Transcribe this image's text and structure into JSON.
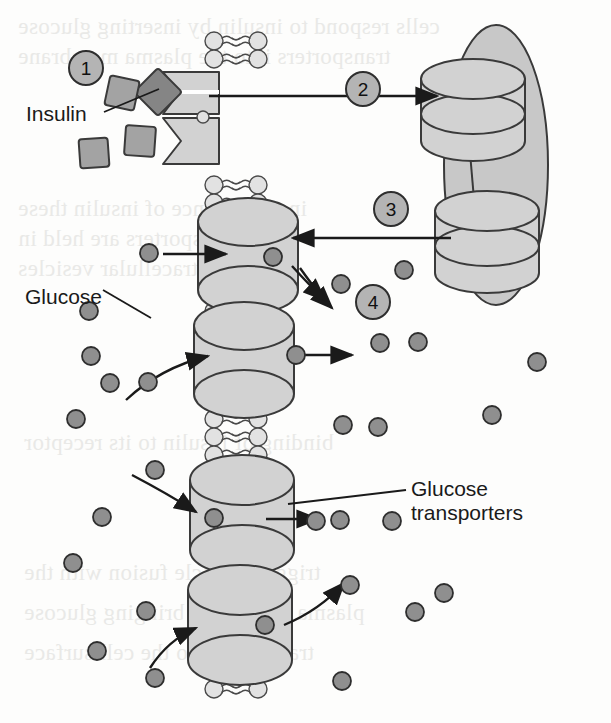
{
  "figure": {
    "background_color": "#fdfdfc"
  },
  "palette": {
    "protein_fill": "#c8c8c8",
    "protein_fill_light": "#d2d2d2",
    "protein_stroke": "#3a3a3a",
    "glucose_fill": "#8f8f8f",
    "glucose_stroke": "#2e2e2e",
    "insulin_fill": "#a3a3a3",
    "insulin_stroke": "#3a3a3a",
    "insulin_dark_fill": "#858585",
    "lipid_head_fill": "#e2e2e2",
    "lipid_stroke": "#4a4a4a",
    "step_circle_fill": "#b4b4b4",
    "step_circle_stroke": "#2e2e2e",
    "arrow_color": "#1a1a1a",
    "text_color": "#1a1a1a",
    "bleed_text_color": "#e9e9e7"
  },
  "labels": {
    "insulin": "Insulin",
    "glucose": "Glucose",
    "transporters_line1": "Glucose",
    "transporters_line2": "transporters"
  },
  "steps": [
    {
      "id": "step-1",
      "number": "1",
      "cx": 86,
      "cy": 68,
      "r": 17
    },
    {
      "id": "step-2",
      "number": "2",
      "cx": 363,
      "cy": 89,
      "r": 17
    },
    {
      "id": "step-3",
      "number": "3",
      "cx": 391,
      "cy": 209,
      "r": 17
    },
    {
      "id": "step-4",
      "number": "4",
      "cx": 373,
      "cy": 302,
      "r": 17
    }
  ],
  "membrane": {
    "left_heads_x": 214,
    "right_heads_x": 258,
    "top": 32,
    "bottom": 706,
    "head_radius": 9,
    "head_spacing": 18,
    "tail_length": 13
  },
  "insulin_receptor": {
    "upper": {
      "x": 163,
      "y": 72,
      "w": 56,
      "h": 42
    },
    "lower": {
      "x": 163,
      "y": 118,
      "w": 56,
      "h": 46
    }
  },
  "insulin_molecules": [
    {
      "id": "insulin-bound",
      "cx": 158,
      "cy": 92,
      "size": 34,
      "rotation": 45,
      "bound": true
    },
    {
      "id": "insulin-free-1",
      "cx": 122,
      "cy": 93,
      "size": 30,
      "rotation": 12,
      "bound": false
    },
    {
      "id": "insulin-free-2",
      "cx": 140,
      "cy": 141,
      "size": 30,
      "rotation": 4,
      "bound": false
    },
    {
      "id": "insulin-free-3",
      "cx": 94,
      "cy": 153,
      "size": 29,
      "rotation": -4,
      "bound": false
    }
  ],
  "vesicle": {
    "cx": 496,
    "cy": 165,
    "rx": 52,
    "ry": 140,
    "cylinders": [
      {
        "id": "vesicle-transporter-upper",
        "cx": 473,
        "cy": 110,
        "rx": 52,
        "ry": 20,
        "h": 62
      },
      {
        "id": "vesicle-transporter-lower",
        "cx": 487,
        "cy": 242,
        "rx": 52,
        "ry": 20,
        "h": 62
      }
    ]
  },
  "membrane_transporters": [
    {
      "id": "transporter-1",
      "cx": 248,
      "cy": 256,
      "rx": 50,
      "ry": 24,
      "gap": 20
    },
    {
      "id": "transporter-2",
      "cx": 244,
      "cy": 360,
      "rx": 50,
      "ry": 24,
      "gap": 20
    },
    {
      "id": "transporter-3",
      "cx": 242,
      "cy": 515,
      "rx": 52,
      "ry": 25,
      "gap": 20
    },
    {
      "id": "transporter-4",
      "cx": 240,
      "cy": 625,
      "rx": 52,
      "ry": 25,
      "gap": 20
    }
  ],
  "glucose_in_channel": [
    {
      "cx": 273,
      "cy": 257
    },
    {
      "cx": 296,
      "cy": 355
    },
    {
      "cx": 214,
      "cy": 518
    },
    {
      "cx": 265,
      "cy": 625
    }
  ],
  "glucose_left": [
    {
      "cx": 149,
      "cy": 253
    },
    {
      "cx": 89,
      "cy": 311
    },
    {
      "cx": 91,
      "cy": 356
    },
    {
      "cx": 110,
      "cy": 383
    },
    {
      "cx": 76,
      "cy": 419
    },
    {
      "cx": 148,
      "cy": 382
    },
    {
      "cx": 155,
      "cy": 470
    },
    {
      "cx": 102,
      "cy": 517
    },
    {
      "cx": 73,
      "cy": 563
    },
    {
      "cx": 146,
      "cy": 611
    },
    {
      "cx": 97,
      "cy": 651
    },
    {
      "cx": 155,
      "cy": 678
    }
  ],
  "glucose_right": [
    {
      "cx": 341,
      "cy": 284
    },
    {
      "cx": 404,
      "cy": 270
    },
    {
      "cx": 380,
      "cy": 343
    },
    {
      "cx": 418,
      "cy": 342
    },
    {
      "cx": 537,
      "cy": 362
    },
    {
      "cx": 343,
      "cy": 425
    },
    {
      "cx": 378,
      "cy": 427
    },
    {
      "cx": 492,
      "cy": 415
    },
    {
      "cx": 316,
      "cy": 521
    },
    {
      "cx": 392,
      "cy": 521
    },
    {
      "cx": 340,
      "cy": 520
    },
    {
      "cx": 350,
      "cy": 585
    },
    {
      "cx": 415,
      "cy": 612
    },
    {
      "cx": 342,
      "cy": 681
    },
    {
      "cx": 444,
      "cy": 593
    }
  ],
  "glucose_radius": 9,
  "arrows": {
    "step2": {
      "x1": 209,
      "y1": 96,
      "x2": 437,
      "y2": 96
    },
    "step3": {
      "x1": 451,
      "y1": 238,
      "x2": 293,
      "y2": 238
    },
    "step4_curve": "M 300 268 Q 320 296 332 308",
    "into_t1": {
      "x1": 163,
      "y1": 254,
      "x2": 226,
      "y2": 254
    },
    "out_t1_curve": "M 292 266 Q 312 288 325 300",
    "into_t2_curve": "M 126 400 Q 160 368 208 356",
    "out_t2": {
      "x1": 302,
      "y1": 355,
      "x2": 352,
      "y2": 355
    },
    "into_t3_curve": "M 132 475 Q 170 495 196 512",
    "out_t3": {
      "x1": 266,
      "y1": 519,
      "x2": 318,
      "y2": 519
    },
    "into_t4_curve": "M 150 668 Q 168 640 196 628",
    "out_t4_curve": "M 284 625 Q 320 610 344 583"
  },
  "leader_lines": {
    "insulin": {
      "x1": 104,
      "y1": 112,
      "x2": 159,
      "y2": 89
    },
    "glucose": {
      "x1": 103,
      "y1": 290,
      "x2": 151,
      "y2": 318
    },
    "transporters": {
      "x1": 406,
      "y1": 490,
      "x2": 288,
      "y2": 504
    }
  },
  "bleed_text": [
    {
      "text": "cells respond to insulin by inserting glucose",
      "x": 18,
      "y": 14
    },
    {
      "text": "transporters into the plasma membrane",
      "x": 18,
      "y": 44
    },
    {
      "text": "in the absence of insulin these",
      "x": 18,
      "y": 196
    },
    {
      "text": "transporters are held in",
      "x": 18,
      "y": 226
    },
    {
      "text": "intracellular vesicles",
      "x": 18,
      "y": 256
    },
    {
      "text": "binding of insulin to its receptor",
      "x": 24,
      "y": 430
    },
    {
      "text": "triggers vesicle fusion with the",
      "x": 24,
      "y": 560
    },
    {
      "text": "plasma membrane bringing glucose",
      "x": 24,
      "y": 600
    },
    {
      "text": "transporters to the cell surface",
      "x": 24,
      "y": 640
    }
  ]
}
